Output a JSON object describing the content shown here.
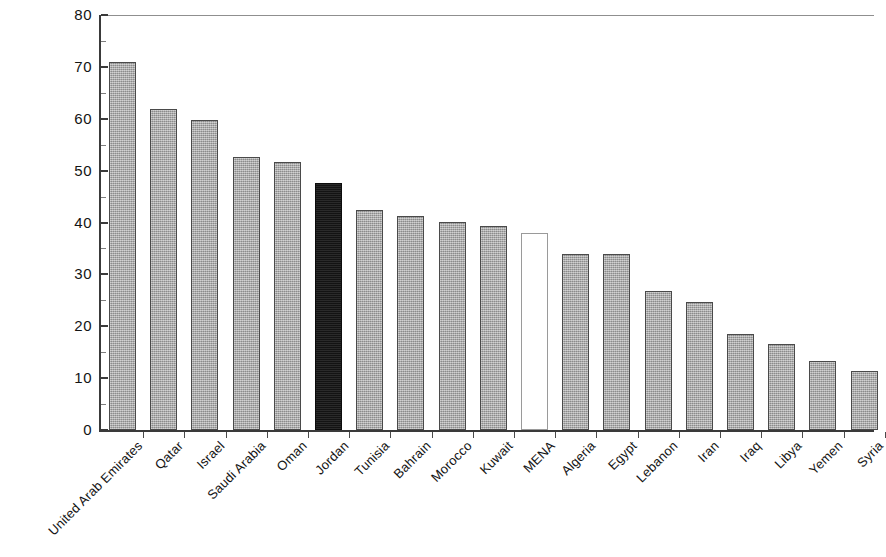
{
  "chart_data": {
    "type": "bar",
    "title": "",
    "subtitle": "",
    "xlabel": "",
    "ylabel": "",
    "ylim": [
      0,
      80
    ],
    "yticks": [
      0,
      10,
      20,
      30,
      40,
      50,
      60,
      70,
      80
    ],
    "ytick_labels": [
      "0",
      "10",
      "20",
      "30",
      "40",
      "50",
      "60",
      "70",
      "80"
    ],
    "grid": false,
    "legend": null,
    "categories": [
      "United Arab Emirates",
      "Qatar",
      "Israel",
      "Saudi Arabia",
      "Oman",
      "Jordan",
      "Tunisia",
      "Bahrain",
      "Morocco",
      "Kuwait",
      "MENA",
      "Algeria",
      "Egypt",
      "Lebanon",
      "Iran",
      "Iraq",
      "Libya",
      "Yemen",
      "Syria"
    ],
    "values": [
      70.9,
      61.8,
      59.8,
      52.6,
      51.6,
      47.6,
      42.5,
      41.3,
      40.1,
      39.3,
      38.0,
      34.0,
      33.9,
      26.8,
      24.7,
      18.6,
      16.6,
      13.4,
      11.4
    ],
    "bar_styles": [
      "grey",
      "grey",
      "grey",
      "grey",
      "grey",
      "black",
      "grey",
      "grey",
      "grey",
      "grey",
      "white",
      "grey",
      "grey",
      "grey",
      "grey",
      "grey",
      "grey",
      "grey",
      "grey"
    ],
    "colors": {
      "bar_grey": "#ababab",
      "bar_black": "#1a1a1a",
      "bar_white": "#ffffff",
      "bar_outline": "#4a4a4a",
      "axis": "#3a3a3a",
      "text": "#141414",
      "background": "#ffffff"
    }
  }
}
